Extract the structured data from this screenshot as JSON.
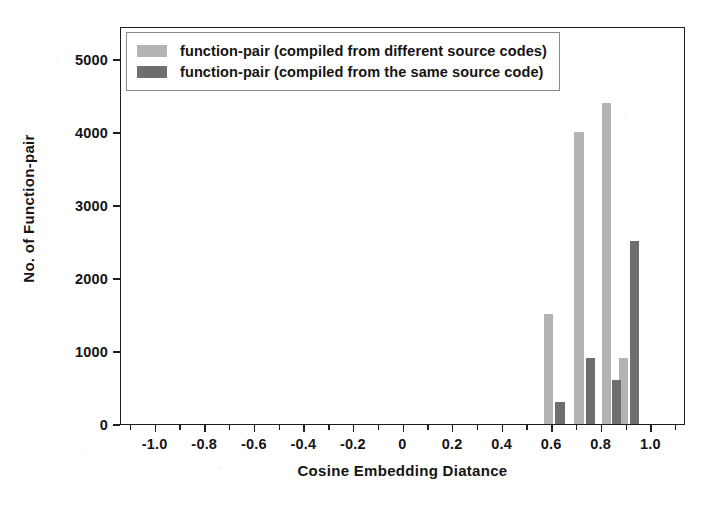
{
  "chart_data": {
    "type": "bar",
    "title": "",
    "subtitle": "",
    "xlabel": "Cosine Embedding Diatance",
    "ylabel": "No. of Function-pair",
    "xlim": [
      -1.14,
      1.14
    ],
    "ylim": [
      0,
      5450
    ],
    "grid": false,
    "legend_position": "upper-left",
    "xticks": [
      -1.0,
      -0.8,
      -0.6,
      -0.4,
      -0.2,
      0,
      0.2,
      0.4,
      0.6,
      0.8,
      1.0
    ],
    "xtick_labels": [
      "-1.0",
      "-0.8",
      "-0.6",
      "-0.4",
      "-0.2",
      "0",
      "0.2",
      "0.4",
      "0.6",
      "0.8",
      "1.0"
    ],
    "xtick_minor": [
      -1.1,
      -0.9,
      -0.7,
      -0.5,
      -0.3,
      -0.1,
      0.1,
      0.3,
      0.5,
      0.7,
      0.9,
      1.1
    ],
    "yticks": [
      0,
      1000,
      2000,
      3000,
      4000,
      5000
    ],
    "ytick_labels": [
      "0",
      "1000",
      "2000",
      "3000",
      "4000",
      "5000"
    ],
    "series": [
      {
        "name": "function-pair (compiled from different source codes)",
        "color": "#b3b3b3",
        "bars": [
          {
            "x": 0.565,
            "width": 0.037,
            "value": 1500
          },
          {
            "x": 0.69,
            "width": 0.037,
            "value": 4000
          },
          {
            "x": 0.8,
            "width": 0.037,
            "value": 4400
          },
          {
            "x": 0.87,
            "width": 0.037,
            "value": 900
          }
        ]
      },
      {
        "name": "function-pair (compiled from the same source code)",
        "color": "#6e6e6e",
        "bars": [
          {
            "x": 0.613,
            "width": 0.037,
            "value": 300
          },
          {
            "x": 0.735,
            "width": 0.037,
            "value": 900
          },
          {
            "x": 0.842,
            "width": 0.037,
            "value": 600
          },
          {
            "x": 0.915,
            "width": 0.037,
            "value": 2500
          }
        ]
      }
    ]
  },
  "legend": {
    "items": [
      {
        "label": "function-pair (compiled from different source codes)",
        "swatch": "light"
      },
      {
        "label": "function-pair (compiled from the same source code)",
        "swatch": "dark"
      }
    ]
  },
  "colors": {
    "series_different": "#b3b3b3",
    "series_same": "#6e6e6e",
    "axis": "#1e1e1e",
    "background": "#ffffff"
  }
}
